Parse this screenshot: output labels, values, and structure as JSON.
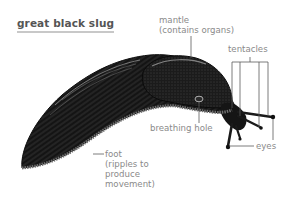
{
  "title": "great black slug",
  "labels": {
    "mantle": [
      "mantle",
      "(contains organs)"
    ],
    "tentacles": "tentacles",
    "breathing_hole": "breathing hole",
    "eyes": "eyes",
    "foot": [
      "foot",
      "(ripples to",
      "produce",
      "movement)"
    ]
  },
  "colors": {
    "label_text": "#8a8a8a",
    "title_text": "#555555",
    "title_underline": "#c8c8c8",
    "leader_lines": "#5a5a5a",
    "slug_body": "#141414",
    "foot_fringe": "#6e6e6e"
  }
}
